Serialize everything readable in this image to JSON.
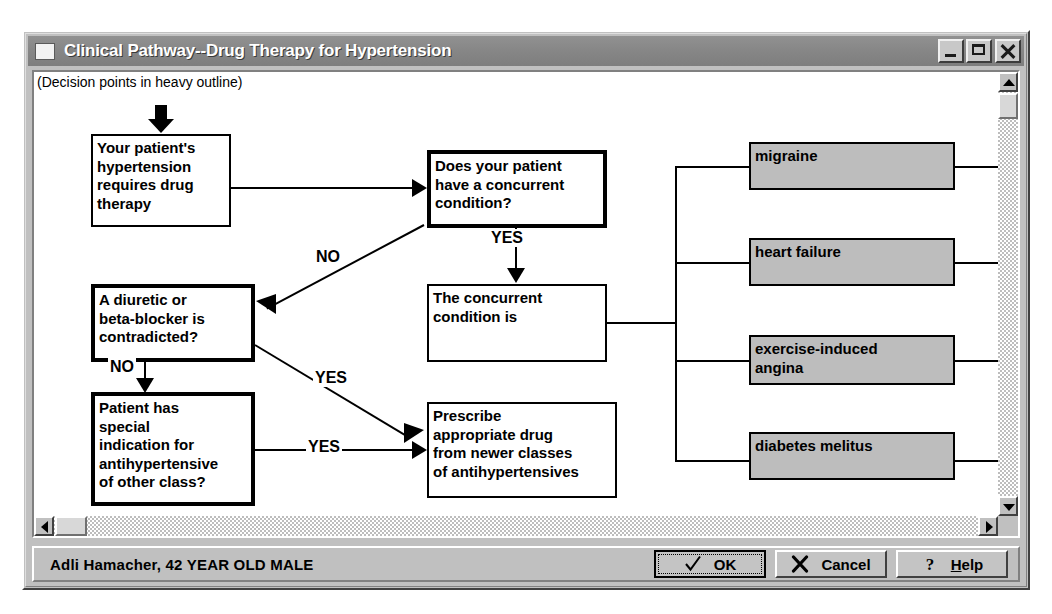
{
  "window": {
    "title": "Clinical Pathway--Drug Therapy for Hypertension",
    "icon": "app-window-icon",
    "controls": {
      "minimize": "minimize-icon",
      "maximize": "maximize-icon",
      "close": "close-icon"
    }
  },
  "canvas": {
    "legend_note": "(Decision points in heavy outline)"
  },
  "flowchart": {
    "nodes": [
      {
        "id": "start",
        "label": "Your patient's\nhypertension\nrequires drug\ntherapy",
        "style": "thin"
      },
      {
        "id": "concurrent-q",
        "label": "Does your patient\nhave a concurrent\ncondition?",
        "style": "heavy"
      },
      {
        "id": "diuretic-q",
        "label": "A diuretic or\nbeta-blocker is\ncontradicted?",
        "style": "heavy"
      },
      {
        "id": "condition-is",
        "label": "The concurrent\ncondition is",
        "style": "thin"
      },
      {
        "id": "indication-q",
        "label": "Patient has\nspecial\nindication for\nantihypertensive\nof other class?",
        "style": "heavy"
      },
      {
        "id": "prescribe",
        "label": "Prescribe\nappropriate drug\nfrom newer classes\nof antihypertensives",
        "style": "thin"
      }
    ],
    "conditions": [
      {
        "id": "migraine",
        "label": "migraine"
      },
      {
        "id": "heart-failure",
        "label": "heart failure"
      },
      {
        "id": "exercise-angina",
        "label": "exercise-induced\nangina"
      },
      {
        "id": "diabetes-melitus",
        "label": "diabetes melitus"
      }
    ],
    "edge_labels": {
      "concurrent_no": "NO",
      "concurrent_yes": "YES",
      "diuretic_no": "NO",
      "diuretic_yes": "YES",
      "indication_yes": "YES"
    }
  },
  "scrollbars": {
    "vertical": {
      "up": "scroll-up-icon",
      "down": "scroll-down-icon"
    },
    "horizontal": {
      "left": "scroll-left-icon",
      "right": "scroll-right-icon"
    }
  },
  "statusbar": {
    "patient_info": "Adli Hamacher, 42 YEAR OLD MALE"
  },
  "buttons": {
    "ok": {
      "label": "OK",
      "icon": "checkmark-icon"
    },
    "cancel": {
      "label": "Cancel",
      "icon": "x-mark-icon"
    },
    "help": {
      "label": "Help",
      "icon": "question-mark-icon",
      "mnemonic": "H",
      "rest": "elp"
    }
  },
  "colors": {
    "window_face": "#c0c0c0",
    "titlebar": "#8a8a8a",
    "condition_box": "#bdbdbd",
    "canvas": "#ffffff",
    "ink": "#000000"
  }
}
